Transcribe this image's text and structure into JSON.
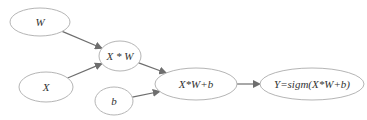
{
  "diagram": {
    "title": "",
    "type": "computation-graph",
    "nodes": [
      {
        "id": "W",
        "label": "W",
        "cx": 40,
        "cy": 22,
        "rx": 30,
        "ry": 14
      },
      {
        "id": "X",
        "label": "X",
        "cx": 46,
        "cy": 87,
        "rx": 27,
        "ry": 15
      },
      {
        "id": "XW",
        "label": "X * W",
        "cx": 120,
        "cy": 56,
        "rx": 21,
        "ry": 15
      },
      {
        "id": "b",
        "label": "b",
        "cx": 114,
        "cy": 101,
        "rx": 19,
        "ry": 14
      },
      {
        "id": "XWb",
        "label": "X*W+b",
        "cx": 196,
        "cy": 84,
        "rx": 41,
        "ry": 16
      },
      {
        "id": "Y",
        "label": "Y=sigm(X*W+b)",
        "cx": 312,
        "cy": 84,
        "rx": 52,
        "ry": 16
      }
    ],
    "edges": [
      {
        "from": "W",
        "to": "XW"
      },
      {
        "from": "X",
        "to": "XW"
      },
      {
        "from": "XW",
        "to": "XWb"
      },
      {
        "from": "b",
        "to": "XWb"
      },
      {
        "from": "XWb",
        "to": "Y"
      }
    ],
    "colors": {
      "node_stroke": "#b5b5b5",
      "edge": "#6e6e6e",
      "text": "#333333"
    }
  }
}
